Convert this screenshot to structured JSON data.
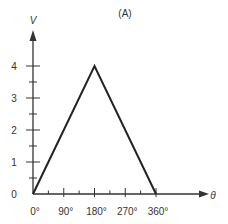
{
  "chart_data": {
    "type": "line",
    "title": "(A)",
    "xlabel": "θ",
    "ylabel": "V",
    "x": [
      0,
      180,
      360
    ],
    "series": [
      {
        "name": "V",
        "values": [
          0,
          4,
          0
        ]
      }
    ],
    "xticks": [
      0,
      90,
      180,
      270,
      360
    ],
    "xtick_labels": [
      "0°",
      "90°",
      "180°",
      "270°",
      "360°"
    ],
    "x_minor_step": 45,
    "yticks": [
      0,
      1,
      2,
      3,
      4
    ],
    "ytick_labels": [
      "0",
      "1",
      "2",
      "3",
      "4"
    ],
    "y_minor_step": 0.5,
    "xlim": [
      0,
      400
    ],
    "ylim": [
      0,
      5
    ],
    "grid": false,
    "legend": null
  },
  "colors": {
    "line": "#222222",
    "axis": "#333333",
    "text": "#333333"
  }
}
